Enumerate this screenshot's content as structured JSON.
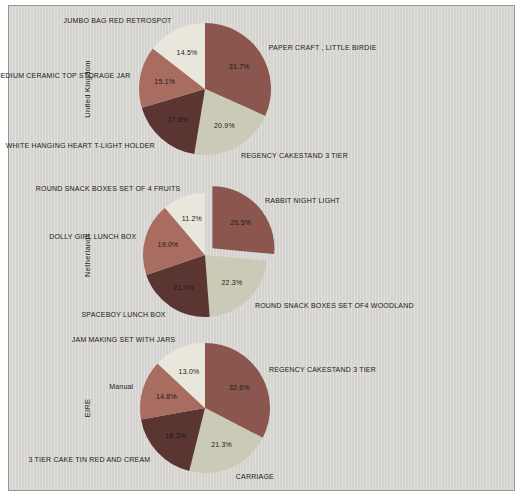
{
  "frame": {
    "page_background": "#ffffff",
    "panel_background": "#d7d6d2",
    "panel_border_color": "#97958e",
    "text_color": "#1a1a1a"
  },
  "chart_data": [
    {
      "type": "pie",
      "country": "United Kingdom",
      "center_x": 205,
      "center_y": 89,
      "radius": 66,
      "start_angle": "top",
      "direction": "clockwise",
      "label_distance": 1.15,
      "pct_distance": 0.62,
      "slices": [
        {
          "label": "PAPER CRAFT , LITTLE BIRDIE",
          "value": 31.7,
          "pct_label": "31.7%",
          "color": "#8a564e",
          "explode": 0
        },
        {
          "label": "REGENCY CAKESTAND 3 TIER",
          "value": 20.9,
          "pct_label": "20.9%",
          "color": "#cbcab6",
          "explode": 0
        },
        {
          "label": "WHITE HANGING HEART T-LIGHT HOLDER",
          "value": 17.8,
          "pct_label": "17.8%",
          "color": "#5a3531",
          "explode": 0
        },
        {
          "label": "MEDIUM CERAMIC TOP STORAGE JAR",
          "value": 15.1,
          "pct_label": "15.1%",
          "color": "#a96c61",
          "explode": 0
        },
        {
          "label": "JUMBO BAG RED RETROSPOT",
          "value": 14.5,
          "pct_label": "14.5%",
          "color": "#e9e7dc",
          "explode": 0
        }
      ]
    },
    {
      "type": "pie",
      "country": "Netherlands",
      "center_x": 205,
      "center_y": 255,
      "radius": 62,
      "start_angle": "top",
      "direction": "clockwise",
      "label_distance": 1.15,
      "pct_distance": 0.62,
      "slices": [
        {
          "label": "RABBIT NIGHT LIGHT",
          "value": 26.5,
          "pct_label": "26.5%",
          "color": "#8a564e",
          "explode": 10
        },
        {
          "label": "ROUND SNACK BOXES SET OF4 WOODLAND",
          "value": 22.3,
          "pct_label": "22.3%",
          "color": "#cbcab6",
          "explode": 0
        },
        {
          "label": "SPACEBOY LUNCH BOX",
          "value": 21.0,
          "pct_label": "21.0%",
          "color": "#5a3531",
          "explode": 0
        },
        {
          "label": "DOLLY GIRL LUNCH BOX",
          "value": 19.0,
          "pct_label": "19.0%",
          "color": "#a96c61",
          "explode": 0
        },
        {
          "label": "ROUND SNACK BOXES SET OF 4 FRUITS",
          "value": 11.2,
          "pct_label": "11.2%",
          "color": "#e9e7dc",
          "explode": 0
        }
      ]
    },
    {
      "type": "pie",
      "country": "EIRE",
      "center_x": 205,
      "center_y": 408,
      "radius": 65,
      "start_angle": "top",
      "direction": "clockwise",
      "label_distance": 1.15,
      "pct_distance": 0.62,
      "slices": [
        {
          "label": "REGENCY CAKESTAND 3 TIER",
          "value": 32.6,
          "pct_label": "32.6%",
          "color": "#8a564e",
          "explode": 0
        },
        {
          "label": "CARRIAGE",
          "value": 21.3,
          "pct_label": "21.3%",
          "color": "#cbcab6",
          "explode": 0
        },
        {
          "label": "3 TIER CAKE TIN RED AND CREAM",
          "value": 18.3,
          "pct_label": "18.3%",
          "color": "#5a3531",
          "explode": 0
        },
        {
          "label": "Manual",
          "value": 14.8,
          "pct_label": "14.8%",
          "color": "#a96c61",
          "explode": 0
        },
        {
          "label": "JAM MAKING SET WITH JARS",
          "value": 13.0,
          "pct_label": "13.0%",
          "color": "#e9e7dc",
          "explode": 0
        }
      ]
    }
  ]
}
